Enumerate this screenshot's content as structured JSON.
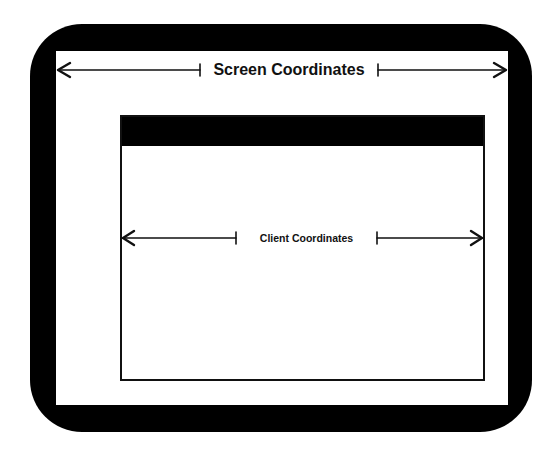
{
  "diagram": {
    "screen": {
      "label": "Screen Coordinates",
      "arrow": {
        "from_x": 58,
        "to_x": 506,
        "y": 70,
        "tick_left_x": 200,
        "tick_right_x": 378
      }
    },
    "client": {
      "label": "Client Coordinates",
      "arrow": {
        "from_x": 123,
        "to_x": 482,
        "y": 238,
        "tick_left_x": 236,
        "tick_right_x": 377
      }
    },
    "colors": {
      "bezel": "#000000",
      "screen": "#ffffff",
      "titlebar": "#000000",
      "line": "#111111"
    }
  }
}
